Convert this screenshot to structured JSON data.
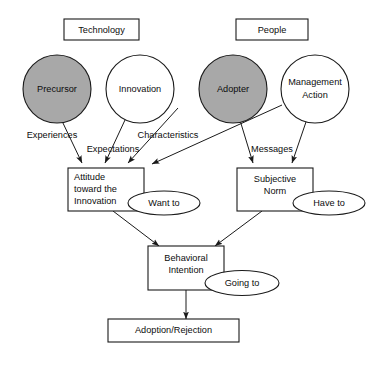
{
  "diagram": {
    "background_color": "#ffffff",
    "stroke_color": "#1a1a1a",
    "shaded_fill_color": "#a8a8a8",
    "plain_fill_color": "#ffffff",
    "group_labels": [
      {
        "id": "technology",
        "label": "Technology"
      },
      {
        "id": "people",
        "label": "People"
      }
    ],
    "circles": [
      {
        "id": "precursor",
        "label": "Precursor",
        "shaded": true
      },
      {
        "id": "innovation",
        "label": "Innovation",
        "shaded": false
      },
      {
        "id": "adopter",
        "label": "Adopter",
        "shaded": true
      },
      {
        "id": "management-action",
        "label_line1": "Management",
        "label_line2": "Action",
        "shaded": false
      }
    ],
    "boxes": [
      {
        "id": "attitude",
        "line1": "Attitude",
        "line2": "toward the",
        "line3": "Innovation"
      },
      {
        "id": "subjective-norm",
        "line1": "Subjective",
        "line2": "Norm"
      },
      {
        "id": "behavioral-intention",
        "line1": "Behavioral",
        "line2": "Intention"
      },
      {
        "id": "adoption-rejection",
        "line1": "Adoption/Rejection"
      }
    ],
    "ellipses": [
      {
        "id": "want-to",
        "label": "Want to"
      },
      {
        "id": "have-to",
        "label": "Have to"
      },
      {
        "id": "going-to",
        "label": "Going to"
      }
    ],
    "edge_labels": [
      {
        "id": "experiences",
        "label": "Experiences"
      },
      {
        "id": "expectations",
        "label": "Expectations"
      },
      {
        "id": "characteristics",
        "label": "Characteristics"
      },
      {
        "id": "messages",
        "label": "Messages"
      }
    ],
    "edges": [
      {
        "from": "precursor",
        "to": "attitude",
        "label": "Experiences"
      },
      {
        "from": "innovation",
        "to": "attitude",
        "label": "Expectations"
      },
      {
        "from": "innovation",
        "to": "attitude",
        "label": "Characteristics"
      },
      {
        "from": "adopter",
        "to": "attitude",
        "label": ""
      },
      {
        "from": "adopter",
        "to": "subjective-norm",
        "label": "Messages"
      },
      {
        "from": "management-action",
        "to": "attitude",
        "label": ""
      },
      {
        "from": "management-action",
        "to": "subjective-norm",
        "label": "Messages"
      },
      {
        "from": "attitude",
        "to": "behavioral-intention",
        "label": ""
      },
      {
        "from": "subjective-norm",
        "to": "behavioral-intention",
        "label": ""
      },
      {
        "from": "behavioral-intention",
        "to": "adoption-rejection",
        "label": ""
      }
    ]
  }
}
